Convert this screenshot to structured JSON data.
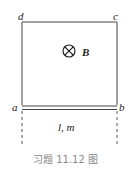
{
  "figure": {
    "corner_labels": {
      "a": "a",
      "b": "b",
      "c": "c",
      "d": "d"
    },
    "field_label": "B",
    "field_direction": "into-page",
    "bar_label": "l, m",
    "caption": "习题 11.12 图"
  }
}
